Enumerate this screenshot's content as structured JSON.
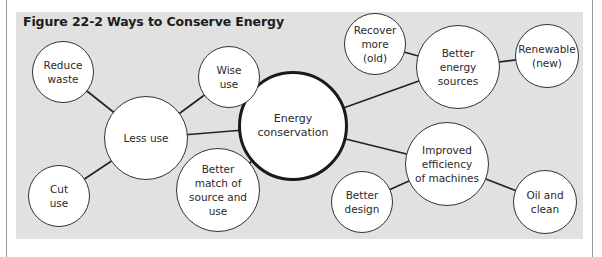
{
  "figure": {
    "title": "Figure 22-2  Ways to Conserve Energy",
    "colors": {
      "panel": "#e1e1e1",
      "node_fill": "#ffffff",
      "stroke": "#222222"
    }
  },
  "nodes": [
    {
      "id": "energy-conservation",
      "label": "Energy\nconservation",
      "cx": 293,
      "cy": 126,
      "r": 55,
      "center": true
    },
    {
      "id": "less-use",
      "label": "Less use",
      "cx": 146,
      "cy": 138,
      "r": 42
    },
    {
      "id": "reduce-waste",
      "label": "Reduce\nwaste",
      "cx": 63,
      "cy": 72,
      "r": 31
    },
    {
      "id": "wise-use",
      "label": "Wise\nuse",
      "cx": 229,
      "cy": 77,
      "r": 31
    },
    {
      "id": "cut-use",
      "label": "Cut\nuse",
      "cx": 59,
      "cy": 196,
      "r": 31
    },
    {
      "id": "better-match",
      "label": "Better\nmatch of\nsource and\nuse",
      "cx": 218,
      "cy": 190,
      "r": 42
    },
    {
      "id": "better-energy-sources",
      "label": "Better\nenergy\nsources",
      "cx": 458,
      "cy": 67,
      "r": 42
    },
    {
      "id": "recover-more",
      "label": "Recover\nmore\n(old)",
      "cx": 375,
      "cy": 44,
      "r": 31
    },
    {
      "id": "renewable",
      "label": "Renewable\n(new)",
      "cx": 547,
      "cy": 56,
      "r": 32
    },
    {
      "id": "improved-efficiency",
      "label": "Improved\nefficiency\nof machines",
      "cx": 447,
      "cy": 164,
      "r": 42
    },
    {
      "id": "better-design",
      "label": "Better\ndesign",
      "cx": 362,
      "cy": 202,
      "r": 31
    },
    {
      "id": "oil-and-clean",
      "label": "Oil and\nclean",
      "cx": 545,
      "cy": 202,
      "r": 32
    }
  ],
  "edges": [
    [
      "less-use",
      "energy-conservation"
    ],
    [
      "less-use",
      "reduce-waste"
    ],
    [
      "less-use",
      "wise-use"
    ],
    [
      "less-use",
      "cut-use"
    ],
    [
      "better-match",
      "energy-conservation"
    ],
    [
      "better-energy-sources",
      "energy-conservation"
    ],
    [
      "better-energy-sources",
      "recover-more"
    ],
    [
      "better-energy-sources",
      "renewable"
    ],
    [
      "improved-efficiency",
      "energy-conservation"
    ],
    [
      "improved-efficiency",
      "better-design"
    ],
    [
      "improved-efficiency",
      "oil-and-clean"
    ]
  ]
}
